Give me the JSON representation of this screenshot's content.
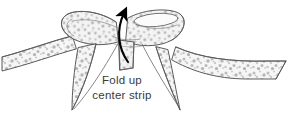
{
  "figure": {
    "background_color": "#ffffff",
    "width": 301,
    "height": 118
  },
  "caption": {
    "line1": "Fold up",
    "line2": "center strip",
    "color": "#3a3a3a",
    "font_size_px": 11.5,
    "align": "center",
    "line1_position": {
      "x": 122,
      "y": 84
    },
    "line2_position": {
      "x": 122,
      "y": 99
    }
  },
  "annotation": {
    "arrow": {
      "name": "fold-up-arrow",
      "direction": "up",
      "curved": true,
      "color": "#000000",
      "tail_position": {
        "x": 128,
        "y": 62
      },
      "head_position": {
        "x": 128,
        "y": 8
      }
    }
  },
  "illustration": {
    "style": "line-drawing",
    "outline_color": "#4a4a4a",
    "texture": "mottled-speckled-gray",
    "texture_color": "#9a9a9a",
    "fill_color": "#f4f4f4",
    "parts": [
      {
        "name": "left-bow-loop",
        "label": "Left bow loop"
      },
      {
        "name": "right-bow-loop",
        "label": "Right bow loop"
      },
      {
        "name": "left-ribbon-tail",
        "label": "Left ribbon tail"
      },
      {
        "name": "right-ribbon-tail",
        "label": "Right ribbon tail"
      },
      {
        "name": "left-streamer",
        "label": "Left hanging streamer"
      },
      {
        "name": "right-streamer",
        "label": "Right hanging streamer"
      },
      {
        "name": "center-strip",
        "label": "Center strip"
      }
    ]
  }
}
